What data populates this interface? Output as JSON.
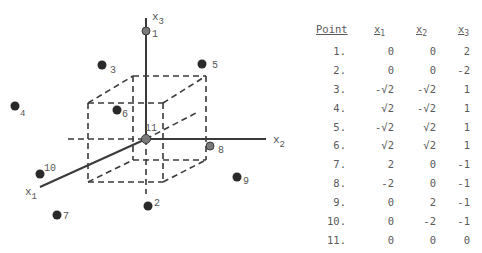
{
  "diagram": {
    "axes": {
      "x1_label": "x",
      "x1_sub": "1",
      "x2_label": "x",
      "x2_sub": "2",
      "x3_label": "x",
      "x3_sub": "3"
    },
    "points": [
      {
        "id": "1",
        "label": "1"
      },
      {
        "id": "2",
        "label": "2"
      },
      {
        "id": "3",
        "label": "3"
      },
      {
        "id": "4",
        "label": "4"
      },
      {
        "id": "5",
        "label": "5"
      },
      {
        "id": "6",
        "label": "6"
      },
      {
        "id": "7",
        "label": "7"
      },
      {
        "id": "8",
        "label": "8"
      },
      {
        "id": "9",
        "label": "9"
      },
      {
        "id": "10",
        "label": "10"
      },
      {
        "id": "11",
        "label": "11"
      }
    ]
  },
  "table": {
    "headers": {
      "point": "Point",
      "x1": "x",
      "x1_sub": "1",
      "x2": "x",
      "x2_sub": "2",
      "x3": "x",
      "x3_sub": "3"
    },
    "rows": [
      {
        "point": "1.",
        "x1": "0",
        "x2": "0",
        "x3": "2"
      },
      {
        "point": "2.",
        "x1": "0",
        "x2": "0",
        "x3": "-2"
      },
      {
        "point": "3.",
        "x1": "-√2",
        "x2": "-√2",
        "x3": "1"
      },
      {
        "point": "4.",
        "x1": "√2",
        "x2": "-√2",
        "x3": "1"
      },
      {
        "point": "5.",
        "x1": "-√2",
        "x2": "√2",
        "x3": "1"
      },
      {
        "point": "6.",
        "x1": "√2",
        "x2": "√2",
        "x3": "1"
      },
      {
        "point": "7.",
        "x1": "2",
        "x2": "0",
        "x3": "-1"
      },
      {
        "point": "8.",
        "x1": "-2",
        "x2": "0",
        "x3": "-1"
      },
      {
        "point": "9.",
        "x1": "0",
        "x2": "2",
        "x3": "-1"
      },
      {
        "point": "10.",
        "x1": "0",
        "x2": "-2",
        "x3": "-1"
      },
      {
        "point": "11.",
        "x1": "0",
        "x2": "0",
        "x3": "0"
      }
    ]
  }
}
